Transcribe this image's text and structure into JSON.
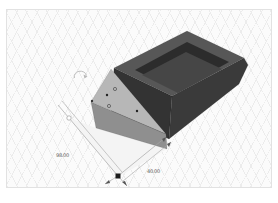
{
  "app": {
    "type": "3d-cad-viewport",
    "canvas_background": "#fbfbfb",
    "grid_line_color": "#ececec",
    "canvas_border_color": "#e2e2e2"
  },
  "dimensions": {
    "left": {
      "label": "98.00"
    },
    "right": {
      "label": "40.00"
    },
    "line_color": "#a6a6a6",
    "marker_color": "#1c1c1c",
    "text_color": "#5a5a5a"
  },
  "icons": {
    "orbit_icon": "curved-rotate-arrow"
  },
  "scene": {
    "faces": {
      "shadow": {
        "points": "68,117 95,127 166,148 117,176",
        "fill": "#f4f4f4"
      },
      "tray_front": {
        "points": "113,67 171,95 168,138 110,112",
        "fill": "#333333"
      },
      "tray_right": {
        "points": "171,95 243,57 247,64 238,83 168,138",
        "fill": "#3a3a3a"
      },
      "tray_rim": {
        "points": "113,67 186,30 243,57 171,95",
        "fill": "#575757"
      },
      "tray_cavity": {
        "points": "134,69 186,41 228,61 176,90",
        "fill": "#2c2c2c"
      },
      "tray_floor": {
        "points": "141,74 185,51 221,68 177,92",
        "fill": "#464646"
      },
      "prism_front": {
        "points": "90,101 165,133 166,148 95,127",
        "fill": "#8f8f8f"
      },
      "prism_face": {
        "points": "110,68 90,101 165,133",
        "fill": "#b7b7b7"
      }
    },
    "lines": {
      "dim_left_a": {
        "x1": 57,
        "y1": 104,
        "x2": 117,
        "y2": 175
      },
      "dim_left_b": {
        "x1": 61,
        "y1": 100,
        "x2": 121,
        "y2": 171
      },
      "dim_right_a": {
        "x1": 117,
        "y1": 175,
        "x2": 165,
        "y2": 136
      },
      "dim_right_b": {
        "x1": 122,
        "y1": 180,
        "x2": 170,
        "y2": 141
      },
      "tick_left": {
        "x1": 117,
        "y1": 175,
        "x2": 104,
        "y2": 183
      },
      "tick_right": {
        "x1": 117,
        "y1": 175,
        "x2": 126,
        "y2": 185
      }
    },
    "arrows": [
      {
        "points": "165,136 161,138 163,141"
      },
      {
        "points": "170,141 166,143 168,146"
      },
      {
        "points": "104,183 108,179 109,182"
      },
      {
        "points": "126,185 121,181 124,180"
      }
    ],
    "markers": {
      "circle": {
        "cx": 68,
        "cy": 117,
        "r": 2.2
      },
      "square": {
        "x": 114.5,
        "y": 172.5,
        "w": 5,
        "h": 5
      }
    },
    "dots": [
      {
        "cx": 114,
        "cy": 88,
        "r": 1.6,
        "kind": "open"
      },
      {
        "cx": 108,
        "cy": 105,
        "r": 1.6,
        "kind": "open"
      },
      {
        "cx": 106,
        "cy": 94,
        "r": 1.2,
        "kind": "filled"
      },
      {
        "cx": 136,
        "cy": 110,
        "r": 1.2,
        "kind": "filled"
      },
      {
        "cx": 91,
        "cy": 100,
        "r": 1.2,
        "kind": "filled"
      }
    ]
  }
}
